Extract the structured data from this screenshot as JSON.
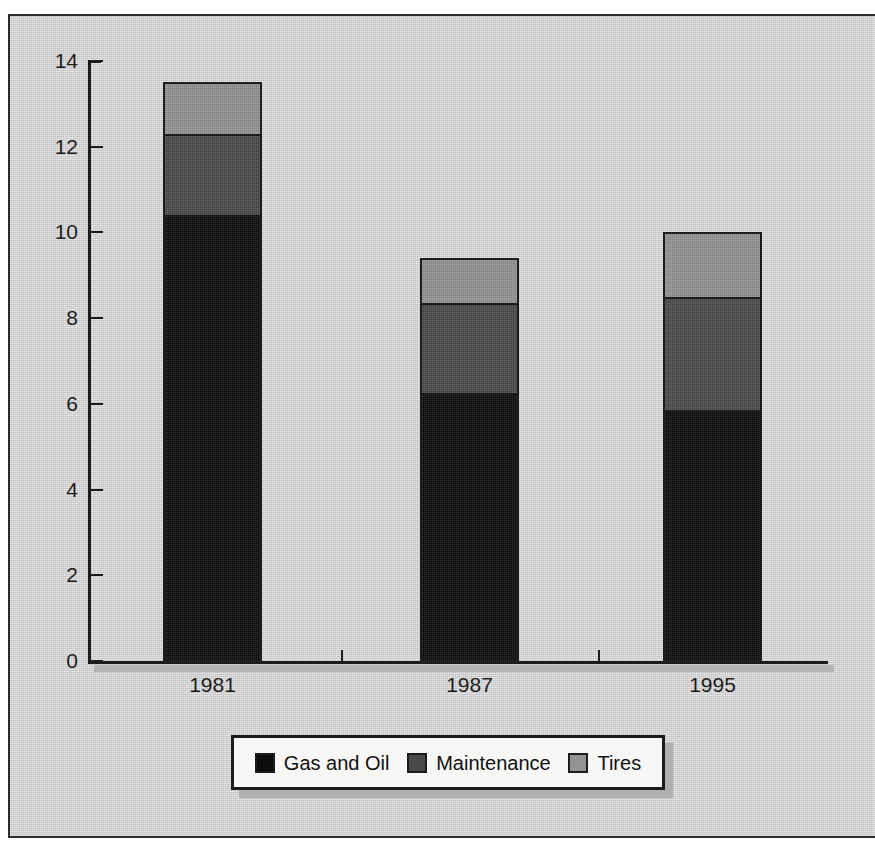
{
  "chart_data": {
    "type": "bar",
    "subtype": "stacked-vertical",
    "title": "",
    "xlabel": "",
    "ylabel": "",
    "categories": [
      "1981",
      "1987",
      "1995"
    ],
    "series": [
      {
        "name": "Gas and Oil",
        "color": "#0d0d0d",
        "values": [
          10.4,
          6.25,
          5.85
        ]
      },
      {
        "name": "Maintenance",
        "color": "#4a4a4a",
        "values": [
          1.9,
          2.1,
          2.65
        ]
      },
      {
        "name": "Tires",
        "color": "#939393",
        "values": [
          1.2,
          1.05,
          1.5
        ]
      }
    ],
    "totals": [
      13.5,
      9.4,
      10.0
    ],
    "ylim": [
      0,
      14
    ],
    "yticks": [
      0,
      2,
      4,
      6,
      8,
      10,
      12,
      14
    ],
    "ytick_labels": [
      "0",
      "2",
      "4",
      "6",
      "8",
      "10",
      "12",
      "14"
    ],
    "grid": false,
    "legend_position": "bottom"
  },
  "axes": {
    "y": {
      "ticks": [
        {
          "label": "14",
          "value": 14
        },
        {
          "label": "12",
          "value": 12
        },
        {
          "label": "10",
          "value": 10
        },
        {
          "label": "8",
          "value": 8
        },
        {
          "label": "6",
          "value": 6
        },
        {
          "label": "4",
          "value": 4
        },
        {
          "label": "2",
          "value": 2
        },
        {
          "label": "0",
          "value": 0
        }
      ]
    },
    "x": {
      "labels": [
        "1981",
        "1987",
        "1995"
      ]
    }
  },
  "legend": {
    "items": [
      {
        "label": "Gas and Oil",
        "color": "#0d0d0d"
      },
      {
        "label": "Maintenance",
        "color": "#4a4a4a"
      },
      {
        "label": "Tires",
        "color": "#939393"
      }
    ]
  },
  "colors": {
    "page_background": "#ffffff",
    "plate_background": "#cdcdcd",
    "frame_line": "#2b2b2b",
    "axis_line": "#1c1c1c",
    "text": "#1d1d1d",
    "legend_background": "#f7f7f5",
    "shadow": "#b0b0b0"
  }
}
